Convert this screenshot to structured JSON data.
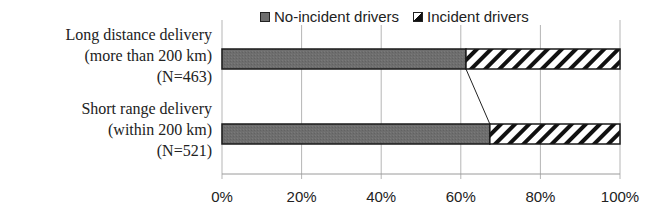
{
  "chart_data": {
    "type": "bar",
    "orientation": "horizontal",
    "stacked": "percent",
    "title": "",
    "xlabel": "",
    "ylabel": "",
    "categories": [
      "Long distance delivery (more than 200 km) (N=463)",
      "Short range delivery (within 200 km) (N=521)"
    ],
    "series": [
      {
        "name": "No-incident drivers",
        "values": [
          61.3,
          67.3
        ],
        "fill": "#6e6e6e",
        "pattern": "solid"
      },
      {
        "name": "Incident drivers",
        "values": [
          38.7,
          32.7
        ],
        "fill": "#111111",
        "pattern": "diagonal-hatch"
      }
    ],
    "xlim": [
      0,
      100
    ],
    "xticks": [
      "0%",
      "20%",
      "40%",
      "60%",
      "80%",
      "100%"
    ],
    "grid": {
      "vertical": true,
      "horizontal": false
    },
    "legend_position": "top",
    "series_lines": true
  },
  "legend": {
    "items": [
      {
        "label": "No-incident drivers"
      },
      {
        "label": "Incident drivers"
      }
    ]
  },
  "categories": [
    {
      "lines": [
        "Long distance delivery",
        "(more than 200 km)",
        "(N=463)"
      ]
    },
    {
      "lines": [
        "Short range delivery",
        "(within 200 km)",
        "(N=521)"
      ]
    }
  ],
  "axis": {
    "ticks": [
      "0%",
      "20%",
      "40%",
      "60%",
      "80%",
      "100%"
    ]
  }
}
